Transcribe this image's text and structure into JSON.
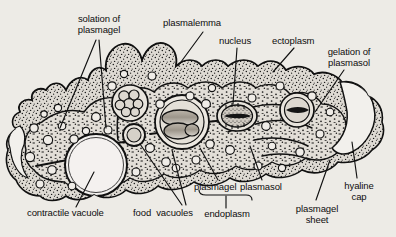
{
  "figure": {
    "background_color": "#e9e7e2",
    "ink_color": "#101010",
    "ectoplasm_color": "#d8d4cd",
    "endoplasm_color": "#cfcac1"
  },
  "labels": {
    "solation_of_plasmagel": "solation of\nplasmagel",
    "plasmalemma": "plasmalemma",
    "nucleus": "nucleus",
    "ectoplasm": "ectoplasm",
    "gelation_of_plasmasol": "gelation of\nplasmasol",
    "hyaline_cap": "hyaline\ncap",
    "plasmagel_sheet": "plasmagel\nsheet",
    "plasmasol": "plasmasol",
    "plasmagel": "plasmagel",
    "endoplasm": "endoplasm",
    "food_vacuoles": "food  vacuoles",
    "contractile_vacuole": "contractile vacuole"
  },
  "structures": {
    "nucleus_label": "nucleus",
    "food_vacuole_count": 3,
    "contractile_vacuole_label": "contractile vacuole",
    "pseudopodia_label": "pseudopodia",
    "flow_arrows": "cytoplasmic streaming arrows"
  }
}
